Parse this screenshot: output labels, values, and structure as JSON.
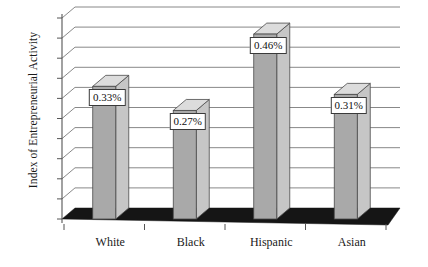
{
  "chart_data": {
    "type": "bar",
    "title": "",
    "subtitle": "",
    "xlabel": "",
    "ylabel": "Index of Entrepreneurial Activity",
    "categories": [
      "White",
      "Black",
      "Hispanic",
      "Asian"
    ],
    "values": [
      0.33,
      0.27,
      0.46,
      0.31
    ],
    "value_labels": [
      "0.33%",
      "0.27%",
      "0.46%",
      "0.31%"
    ],
    "series": [
      {
        "name": "Index of Entrepreneurial Activity",
        "values": [
          0.33,
          0.27,
          0.46,
          0.31
        ]
      }
    ],
    "ylim": [
      0.0,
      0.5
    ],
    "ytick_labels": [
      "0.00",
      "0.05",
      "0.10",
      "0.15",
      "0.20",
      "0.25",
      "0.30",
      "0.35",
      "0.40",
      "0.45",
      "0.50"
    ],
    "ytick_values": [
      0.0,
      0.05,
      0.1,
      0.15,
      0.2,
      0.25,
      0.3,
      0.35,
      0.4,
      0.45,
      0.5
    ],
    "grid": true,
    "grid_axis": "y",
    "legend": false,
    "legend_position": "none",
    "three_d": true,
    "bar_colors": {
      "front": "#a9a9a9",
      "side": "#c6c6c6",
      "top": "#dcdcdc",
      "outline": "#4a4a4a"
    },
    "floor_color": "#151515",
    "axis_color": "#555555",
    "grid_color": "#7a7a7a",
    "background": "#ffffff"
  }
}
